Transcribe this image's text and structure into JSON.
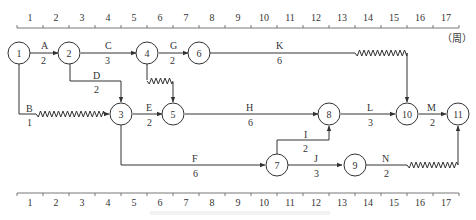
{
  "chart_data": {
    "type": "diagram",
    "title": "",
    "timeline_unit": "（周）",
    "timeline_ticks": [
      "1",
      "2",
      "3",
      "4",
      "5",
      "6",
      "7",
      "8",
      "9",
      "10",
      "11",
      "12",
      "13",
      "14",
      "15",
      "16",
      "17"
    ],
    "nodes": [
      {
        "id": "1",
        "t": 0,
        "row": 0
      },
      {
        "id": "2",
        "t": 2,
        "row": 0
      },
      {
        "id": "4",
        "t": 5,
        "row": 0
      },
      {
        "id": "6",
        "t": 7,
        "row": 0
      },
      {
        "id": "3",
        "t": 4,
        "row": 1
      },
      {
        "id": "5",
        "t": 6,
        "row": 1
      },
      {
        "id": "8",
        "t": 12,
        "row": 1
      },
      {
        "id": "10",
        "t": 15,
        "row": 1
      },
      {
        "id": "11",
        "t": 17,
        "row": 1
      },
      {
        "id": "7",
        "t": 10,
        "row": 2
      },
      {
        "id": "9",
        "t": 13,
        "row": 2
      }
    ],
    "activities": [
      {
        "name": "A",
        "duration": "2",
        "from": "1",
        "to": "2"
      },
      {
        "name": "B",
        "duration": "1",
        "from": "1",
        "to": "3",
        "free_float": 3
      },
      {
        "name": "C",
        "duration": "3",
        "from": "2",
        "to": "4"
      },
      {
        "name": "D",
        "duration": "2",
        "from": "2",
        "to": "3"
      },
      {
        "name": "G",
        "duration": "2",
        "from": "4",
        "to": "6"
      },
      {
        "name": "virtual",
        "duration": "",
        "from": "4",
        "to": "5",
        "free_float": 1
      },
      {
        "name": "E",
        "duration": "2",
        "from": "3",
        "to": "5"
      },
      {
        "name": "F",
        "duration": "6",
        "from": "3",
        "to": "7"
      },
      {
        "name": "K",
        "duration": "6",
        "from": "6",
        "to": "10",
        "free_float": 2
      },
      {
        "name": "H",
        "duration": "6",
        "from": "5",
        "to": "8"
      },
      {
        "name": "I",
        "duration": "2",
        "from": "7",
        "to": "8"
      },
      {
        "name": "J",
        "duration": "3",
        "from": "7",
        "to": "9"
      },
      {
        "name": "L",
        "duration": "3",
        "from": "8",
        "to": "10"
      },
      {
        "name": "M",
        "duration": "2",
        "from": "10",
        "to": "11"
      },
      {
        "name": "N",
        "duration": "2",
        "from": "9",
        "to": "11",
        "free_float": 2
      }
    ]
  },
  "labels": {
    "A": "A",
    "A_d": "2",
    "B": "B",
    "B_d": "1",
    "C": "C",
    "C_d": "3",
    "D": "D",
    "D_d": "2",
    "E": "E",
    "E_d": "2",
    "F": "F",
    "F_d": "6",
    "G": "G",
    "G_d": "2",
    "H": "H",
    "H_d": "6",
    "I": "I",
    "I_d": "2",
    "J": "J",
    "J_d": "3",
    "K": "K",
    "K_d": "6",
    "L": "L",
    "L_d": "3",
    "M": "M",
    "M_d": "2",
    "N": "N",
    "N_d": "2"
  },
  "node_labels": {
    "n1": "1",
    "n2": "2",
    "n3": "3",
    "n4": "4",
    "n5": "5",
    "n6": "6",
    "n7": "7",
    "n8": "8",
    "n9": "9",
    "n10": "10",
    "n11": "11"
  },
  "axis": {
    "ticks": [
      "1",
      "2",
      "3",
      "4",
      "5",
      "6",
      "7",
      "8",
      "9",
      "10",
      "11",
      "12",
      "13",
      "14",
      "15",
      "16",
      "17"
    ],
    "unit": "（周）"
  }
}
